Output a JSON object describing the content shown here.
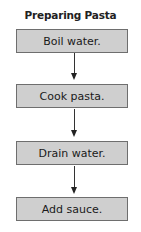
{
  "diagram": {
    "title": "Preparing Pasta",
    "type": "flowchart",
    "direction": "top-to-bottom",
    "steps": [
      {
        "label": "Boil water."
      },
      {
        "label": "Cook pasta."
      },
      {
        "label": "Drain water."
      },
      {
        "label": "Add sauce."
      }
    ],
    "colors": {
      "box_fill": "#cfcfcf",
      "box_border": "#6e6e6e",
      "arrow": "#222222",
      "text": "#1a1a1a"
    }
  }
}
